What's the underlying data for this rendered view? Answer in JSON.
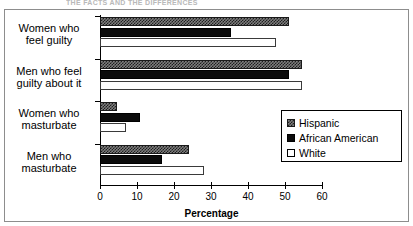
{
  "top_remnant": "THE FACTS AND THE DIFFERENCES",
  "legend": {
    "position": "inside-right",
    "entries": [
      {
        "label": "Hispanic",
        "swatch": "checkered-grey-swatch",
        "color": "#7d7d7d"
      },
      {
        "label": "African American",
        "swatch": "black-swatch",
        "color": "#0b0b0b"
      },
      {
        "label": "White",
        "swatch": "white-swatch",
        "color": "#ffffff"
      }
    ]
  },
  "chart_data": {
    "type": "bar",
    "orientation": "horizontal",
    "title": "",
    "xlabel": "Percentage",
    "ylabel": "",
    "xlim": [
      0,
      60
    ],
    "xticks": [
      0,
      10,
      20,
      30,
      40,
      50,
      60
    ],
    "xtick_labels": [
      "0",
      "10",
      "20",
      "30",
      "40",
      "50",
      "60"
    ],
    "grid": false,
    "categories": [
      "Women who feel guilty",
      "Men who feel guilty about it",
      "Women who masturbate",
      "Men who masturbate"
    ],
    "category_lines": [
      [
        "Women who",
        "feel guilty"
      ],
      [
        "Men who feel",
        "guilty about it"
      ],
      [
        "Women who",
        "masturbate"
      ],
      [
        "Men who",
        "masturbate"
      ]
    ],
    "series": [
      {
        "name": "Hispanic",
        "values": [
          51,
          54.5,
          4.5,
          24
        ]
      },
      {
        "name": "African American",
        "values": [
          35.5,
          51,
          10.7,
          16.7
        ]
      },
      {
        "name": "White",
        "values": [
          47.5,
          54.5,
          7,
          28
        ]
      }
    ]
  }
}
